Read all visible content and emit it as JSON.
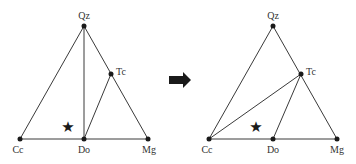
{
  "diagrams": [
    {
      "name": "before",
      "labels": {
        "Qz": "Qz",
        "Tc": "Tc",
        "Cc": "Cc",
        "Do": "Do",
        "Mg": "Mg"
      },
      "tie_lines": [
        "Qz-Do",
        "Do-Tc"
      ],
      "star": "★"
    },
    {
      "name": "after",
      "labels": {
        "Qz": "Qz",
        "Tc": "Tc",
        "Cc": "Cc",
        "Do": "Do",
        "Mg": "Mg"
      },
      "tie_lines": [
        "Cc-Tc",
        "Do-Tc"
      ],
      "star": "★"
    }
  ],
  "arrow": {
    "direction": "right",
    "color": "#1a1a1a"
  },
  "colors": {
    "line": "#3a3a3a",
    "node": "#1a1a1a",
    "label": "#333333"
  }
}
